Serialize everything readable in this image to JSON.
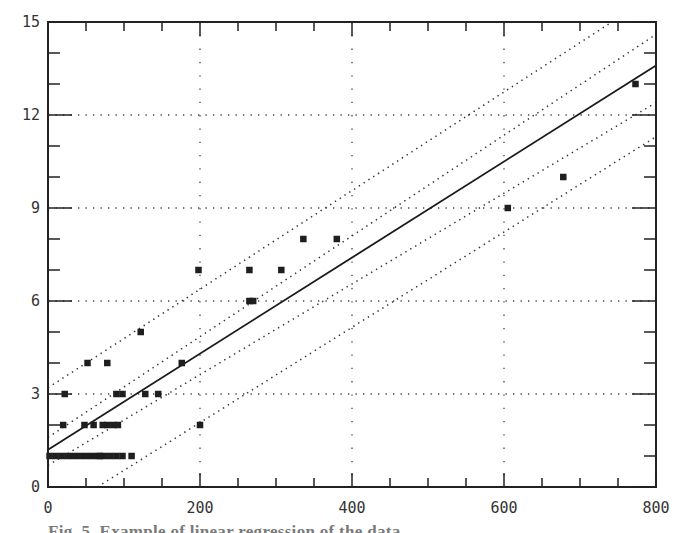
{
  "chart_data": {
    "type": "scatter",
    "title": "",
    "xlabel": "",
    "ylabel": "",
    "xlim": [
      0,
      800
    ],
    "ylim": [
      0,
      15
    ],
    "x_ticks": [
      0,
      200,
      400,
      600,
      800
    ],
    "y_ticks": [
      0,
      3,
      6,
      9,
      12,
      15
    ],
    "grid": "dotted at labeled ticks",
    "legend": null,
    "points": [
      {
        "x": 2,
        "y": 1
      },
      {
        "x": 10,
        "y": 1
      },
      {
        "x": 18,
        "y": 1
      },
      {
        "x": 26,
        "y": 1
      },
      {
        "x": 34,
        "y": 1
      },
      {
        "x": 42,
        "y": 1
      },
      {
        "x": 50,
        "y": 1
      },
      {
        "x": 58,
        "y": 1
      },
      {
        "x": 66,
        "y": 1
      },
      {
        "x": 74,
        "y": 1
      },
      {
        "x": 82,
        "y": 1
      },
      {
        "x": 90,
        "y": 1
      },
      {
        "x": 98,
        "y": 1
      },
      {
        "x": 110,
        "y": 1
      },
      {
        "x": 68,
        "y": 1
      },
      {
        "x": 20,
        "y": 2
      },
      {
        "x": 48,
        "y": 2
      },
      {
        "x": 60,
        "y": 2
      },
      {
        "x": 72,
        "y": 2
      },
      {
        "x": 78,
        "y": 2
      },
      {
        "x": 86,
        "y": 2
      },
      {
        "x": 92,
        "y": 2
      },
      {
        "x": 200,
        "y": 2
      },
      {
        "x": 22,
        "y": 3
      },
      {
        "x": 90,
        "y": 3
      },
      {
        "x": 98,
        "y": 3
      },
      {
        "x": 128,
        "y": 3
      },
      {
        "x": 145,
        "y": 3
      },
      {
        "x": 52,
        "y": 4
      },
      {
        "x": 78,
        "y": 4
      },
      {
        "x": 176,
        "y": 4
      },
      {
        "x": 122,
        "y": 5
      },
      {
        "x": 265,
        "y": 6
      },
      {
        "x": 270,
        "y": 6
      },
      {
        "x": 198,
        "y": 7
      },
      {
        "x": 265,
        "y": 7
      },
      {
        "x": 307,
        "y": 7
      },
      {
        "x": 336,
        "y": 8
      },
      {
        "x": 380,
        "y": 8
      },
      {
        "x": 605,
        "y": 9
      },
      {
        "x": 678,
        "y": 10
      },
      {
        "x": 773,
        "y": 13
      }
    ],
    "series": [
      {
        "name": "regression",
        "style": "solid",
        "x": [
          0,
          800
        ],
        "y": [
          1.2,
          13.6
        ]
      },
      {
        "name": "inner-upper-band",
        "style": "dotted",
        "x": [
          0,
          800
        ],
        "y": [
          1.6,
          14.6
        ]
      },
      {
        "name": "inner-lower-band",
        "style": "dotted",
        "x": [
          0,
          800
        ],
        "y": [
          0.7,
          12.4
        ]
      },
      {
        "name": "outer-upper-band",
        "style": "dotted",
        "x": [
          0,
          742
        ],
        "y": [
          3.2,
          15
        ]
      },
      {
        "name": "outer-lower-band",
        "style": "dotted",
        "x": [
          65,
          800
        ],
        "y": [
          0,
          11.3
        ]
      }
    ]
  },
  "labels": {
    "x_ticks": [
      "0",
      "200",
      "400",
      "600",
      "800"
    ],
    "y_ticks": [
      "0",
      "3",
      "6",
      "9",
      "12",
      "15"
    ]
  },
  "caption": "Fig. 5. Example of linear regression of the data"
}
